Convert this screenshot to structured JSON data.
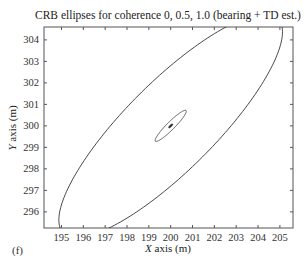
{
  "chart_data": {
    "type": "line",
    "title": "CRB ellipses for coherence 0, 0.5, 1.0 (bearing + TD est.)",
    "xlabel_italic": "X",
    "xlabel_rest": " axis (m)",
    "ylabel_italic": "Y",
    "ylabel_rest": " axis (m)",
    "panel_label": "(f)",
    "xlim": [
      194.2,
      205.6
    ],
    "ylim": [
      295.25,
      304.6
    ],
    "xticks": [
      195,
      196,
      197,
      198,
      199,
      200,
      201,
      202,
      203,
      204,
      205
    ],
    "yticks": [
      296,
      297,
      298,
      299,
      300,
      301,
      302,
      303,
      304
    ],
    "grid": false,
    "center": {
      "x": 200,
      "y": 300
    },
    "series": [
      {
        "name": "coherence 0",
        "cx": 200,
        "cy": 300,
        "semi_major": 7.0,
        "semi_minor": 2.05,
        "angle_deg": 45.5
      },
      {
        "name": "coherence 0.5",
        "cx": 200,
        "cy": 300,
        "semi_major": 1.0,
        "semi_minor": 0.18,
        "angle_deg": 45.5
      },
      {
        "name": "coherence 1.0",
        "cx": 200,
        "cy": 300,
        "semi_major": 0.12,
        "semi_minor": 0.04,
        "angle_deg": 45.5
      }
    ]
  }
}
